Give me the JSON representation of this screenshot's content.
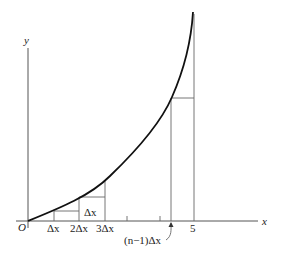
{
  "figure": {
    "axes": {
      "x_label": "x",
      "y_label": "y",
      "origin_label": "O"
    },
    "tick_labels": {
      "dx": "Δx",
      "two_dx": "2Δx",
      "three_dx": "3Δx",
      "n_minus_1_dx": "(n−1)Δx",
      "five": "5"
    },
    "rect_label": "Δx"
  }
}
